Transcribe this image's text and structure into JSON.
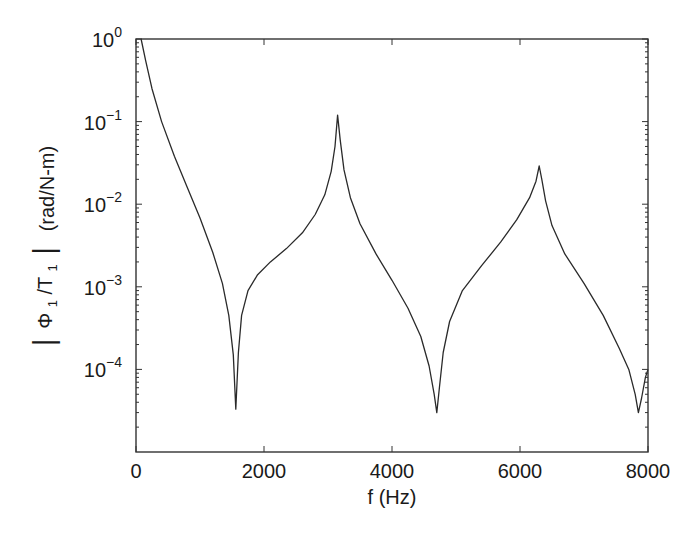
{
  "chart_data": {
    "type": "line",
    "title": "",
    "xlabel": "f (Hz)",
    "ylabel": "|Φ1/T1| (rad/N-m)",
    "ylabel_parts": {
      "bar_left": "|",
      "phi": "Φ",
      "phi_sub": "1",
      "slash": "/T",
      "t_sub": "1",
      "bar_right": "|",
      "units": "(rad/N-m)"
    },
    "xscale": "linear",
    "yscale": "log",
    "xlim": [
      0,
      8000
    ],
    "ylim": [
      1e-05,
      1
    ],
    "x_ticks": [
      0,
      2000,
      4000,
      6000,
      8000
    ],
    "x_tick_labels": [
      "0",
      "2000",
      "4000",
      "6000",
      "8000"
    ],
    "y_ticks": [
      1,
      0.1,
      0.01,
      0.001,
      0.0001
    ],
    "y_tick_labels": [
      {
        "base": "10",
        "exp": "0"
      },
      {
        "base": "10",
        "exp": "−1"
      },
      {
        "base": "10",
        "exp": "−2"
      },
      {
        "base": "10",
        "exp": "−3"
      },
      {
        "base": "10",
        "exp": "−4"
      }
    ],
    "grid": false,
    "legend": null,
    "series": [
      {
        "name": "|Φ1/T1|",
        "color": "#2a2a2a",
        "x": [
          80,
          150,
          250,
          400,
          600,
          800,
          1000,
          1200,
          1350,
          1450,
          1520,
          1560,
          1600,
          1650,
          1750,
          1900,
          2100,
          2350,
          2600,
          2800,
          2950,
          3050,
          3110,
          3150,
          3190,
          3250,
          3350,
          3500,
          3750,
          4000,
          4250,
          4450,
          4580,
          4660,
          4700,
          4740,
          4800,
          4900,
          5100,
          5400,
          5700,
          5950,
          6150,
          6250,
          6300,
          6340,
          6400,
          6500,
          6700,
          7000,
          7300,
          7550,
          7700,
          7800,
          7850,
          7900,
          7960,
          8000
        ],
        "y": [
          1.0,
          0.55,
          0.25,
          0.1,
          0.038,
          0.016,
          0.0068,
          0.0026,
          0.0011,
          0.00045,
          0.00015,
          3.3e-05,
          0.00016,
          0.00045,
          0.0009,
          0.0014,
          0.002,
          0.0029,
          0.0045,
          0.0075,
          0.013,
          0.025,
          0.05,
          0.12,
          0.06,
          0.026,
          0.012,
          0.0058,
          0.0025,
          0.0012,
          0.00055,
          0.00025,
          0.00011,
          5e-05,
          3e-05,
          6e-05,
          0.00016,
          0.00038,
          0.0009,
          0.0018,
          0.0035,
          0.0065,
          0.012,
          0.019,
          0.029,
          0.02,
          0.011,
          0.0055,
          0.0025,
          0.0011,
          0.00045,
          0.00018,
          0.0001,
          5e-05,
          3e-05,
          4.5e-05,
          8e-05,
          0.0001
        ]
      }
    ],
    "features": {
      "peaks": [
        {
          "f": 3150,
          "value": 0.12
        },
        {
          "f": 6300,
          "value": 0.029
        }
      ],
      "antiresonances": [
        {
          "f": 1560,
          "value": 3.3e-05
        },
        {
          "f": 4700,
          "value": 3e-05
        },
        {
          "f": 7850,
          "value": 3e-05
        }
      ]
    }
  }
}
